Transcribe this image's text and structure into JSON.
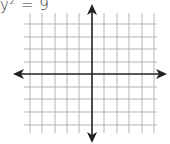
{
  "equation": {
    "variable": "y",
    "exponent": "2",
    "rest": " = 9"
  },
  "graph": {
    "type": "coordinate-plane",
    "grid_lines_vertical_x": [
      30,
      42,
      55,
      67,
      79,
      104,
      117,
      129,
      142,
      154
    ],
    "grid_lines_horizontal_y": [
      24,
      37,
      49,
      62,
      87,
      99,
      112,
      125
    ],
    "x_axis_y": 74,
    "y_axis_x": 92,
    "grid_color": "#b5b5b5",
    "axis_color": "#222222"
  }
}
